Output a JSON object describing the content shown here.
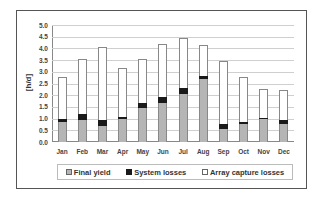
{
  "chart_data": {
    "type": "bar",
    "stacked": true,
    "title": "",
    "xlabel": "",
    "ylabel": "[h/d]",
    "ylim": [
      0,
      5.0
    ],
    "yticks": [
      "0.0",
      "0.5",
      "1.0",
      "1.5",
      "2.0",
      "2.5",
      "3.0",
      "3.5",
      "4.0",
      "4.5",
      "5.0"
    ],
    "grid": true,
    "legend_position": "bottom",
    "categories": [
      "Jan",
      "Feb",
      "Mar",
      "Apr",
      "May",
      "Jun",
      "Jul",
      "Aug",
      "Sep",
      "Oct",
      "Nov",
      "Dec"
    ],
    "series": [
      {
        "name": "Final yield",
        "color": "#b5b5b5",
        "values": [
          0.85,
          0.95,
          0.7,
          1.0,
          1.45,
          1.65,
          2.07,
          2.7,
          0.55,
          0.75,
          0.98,
          0.75
        ]
      },
      {
        "name": "System losses",
        "color": "#1a1a1a",
        "values": [
          0.12,
          0.23,
          0.23,
          0.07,
          0.22,
          0.28,
          0.25,
          0.13,
          0.22,
          0.12,
          0.03,
          0.18
        ]
      },
      {
        "name": "Array capture losses",
        "color": "#ffffff",
        "values": [
          1.8,
          2.37,
          3.12,
          2.1,
          1.88,
          2.27,
          2.13,
          1.3,
          2.7,
          1.9,
          1.25,
          1.3
        ]
      }
    ]
  },
  "legend": {
    "items": [
      {
        "label": "Final yield"
      },
      {
        "label": "System losses"
      },
      {
        "label": "Array capture losses"
      }
    ]
  }
}
